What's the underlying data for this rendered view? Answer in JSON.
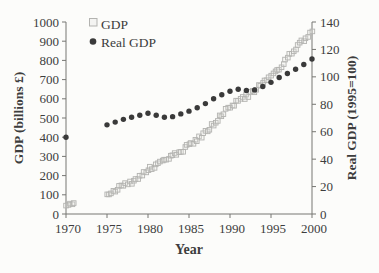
{
  "figure": {
    "background": "#fcfcfa",
    "text_color": "#3d3d3d",
    "axis_color": "#767672"
  },
  "chart_data": {
    "type": "scatter",
    "title": "",
    "xlabel": "Year",
    "left_axis": {
      "label": "GDP (billions £)",
      "range": [
        0,
        1000
      ],
      "ticks": [
        0,
        100,
        200,
        300,
        400,
        500,
        600,
        700,
        800,
        900,
        1000
      ]
    },
    "right_axis": {
      "label": "Real GDP (1995=100)",
      "range": [
        0,
        140
      ],
      "ticks": [
        0,
        20,
        40,
        60,
        80,
        100,
        120,
        140
      ]
    },
    "x_axis": {
      "range": [
        1970,
        2000
      ],
      "ticks": [
        1970,
        1975,
        1980,
        1985,
        1990,
        1995,
        2000
      ]
    },
    "grid": false,
    "legend_position": "top-left-inside",
    "legend": [
      {
        "label": "GDP",
        "marker": "open-square",
        "color": "#b3b3b0"
      },
      {
        "label": "Real GDP",
        "marker": "filled-circle",
        "color": "#3a3a3a"
      }
    ],
    "series": [
      {
        "name": "GDP",
        "axis": "left",
        "marker": "open-square",
        "color": "#b3b3b0",
        "render": "quarterly-band",
        "years": [
          1970,
          1971,
          1975,
          1976,
          1977,
          1978,
          1979,
          1980,
          1981,
          1982,
          1983,
          1984,
          1985,
          1986,
          1987,
          1988,
          1989,
          1990,
          1991,
          1992,
          1993,
          1994,
          1995,
          1996,
          1997,
          1998,
          1999,
          2000
        ],
        "values": [
          52,
          57,
          106,
          125,
          146,
          168,
          197,
          231,
          254,
          278,
          304,
          325,
          357,
          384,
          423,
          471,
          516,
          558,
          587,
          612,
          643,
          681,
          719,
          762,
          811,
          860,
          906,
          951
        ]
      },
      {
        "name": "Real GDP",
        "axis": "right",
        "marker": "filled-circle",
        "color": "#3a3a3a",
        "render": "annual-points",
        "years": [
          1970,
          1975,
          1976,
          1977,
          1978,
          1979,
          1980,
          1981,
          1982,
          1983,
          1984,
          1985,
          1986,
          1987,
          1988,
          1989,
          1990,
          1991,
          1992,
          1993,
          1994,
          1995,
          1996,
          1997,
          1998,
          1999,
          2000
        ],
        "values": [
          56,
          65,
          67,
          69,
          70.5,
          72,
          73.5,
          72,
          70.5,
          71,
          73,
          75,
          77.5,
          80.5,
          84,
          87,
          89.5,
          91,
          90,
          90.5,
          93,
          96,
          99.5,
          102.5,
          105.5,
          109,
          113
        ]
      }
    ],
    "layout": {
      "plot_left": 66,
      "plot_right": 312,
      "plot_top": 22,
      "plot_bottom": 214
    }
  }
}
